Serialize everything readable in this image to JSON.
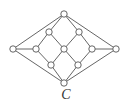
{
  "diagram": {
    "label": "C",
    "colors": {
      "stroke": "#555555",
      "node_fill": "#ffffff",
      "background": "#ffffff"
    },
    "node_radius": 3.2,
    "nodes": [
      {
        "id": "top",
        "x": 64,
        "y": 14
      },
      {
        "id": "upper-left",
        "x": 49,
        "y": 32
      },
      {
        "id": "upper-right",
        "x": 79,
        "y": 32
      },
      {
        "id": "left",
        "x": 13,
        "y": 49
      },
      {
        "id": "mid-left",
        "x": 36,
        "y": 49
      },
      {
        "id": "center",
        "x": 64,
        "y": 49
      },
      {
        "id": "mid-right",
        "x": 92,
        "y": 49
      },
      {
        "id": "right",
        "x": 116,
        "y": 49
      },
      {
        "id": "lower-left",
        "x": 51,
        "y": 65
      },
      {
        "id": "lower-right",
        "x": 78,
        "y": 65
      },
      {
        "id": "bottom",
        "x": 64,
        "y": 83
      }
    ],
    "edges": [
      [
        "top",
        "left"
      ],
      [
        "top",
        "upper-left"
      ],
      [
        "top",
        "upper-right"
      ],
      [
        "top",
        "right"
      ],
      [
        "upper-left",
        "mid-left"
      ],
      [
        "upper-left",
        "center"
      ],
      [
        "upper-right",
        "center"
      ],
      [
        "upper-right",
        "mid-right"
      ],
      [
        "left",
        "mid-left"
      ],
      [
        "mid-right",
        "right"
      ],
      [
        "mid-left",
        "lower-left"
      ],
      [
        "center",
        "lower-left"
      ],
      [
        "center",
        "lower-right"
      ],
      [
        "mid-right",
        "lower-right"
      ],
      [
        "lower-left",
        "bottom"
      ],
      [
        "lower-right",
        "bottom"
      ],
      [
        "left",
        "bottom"
      ],
      [
        "right",
        "bottom"
      ]
    ]
  }
}
